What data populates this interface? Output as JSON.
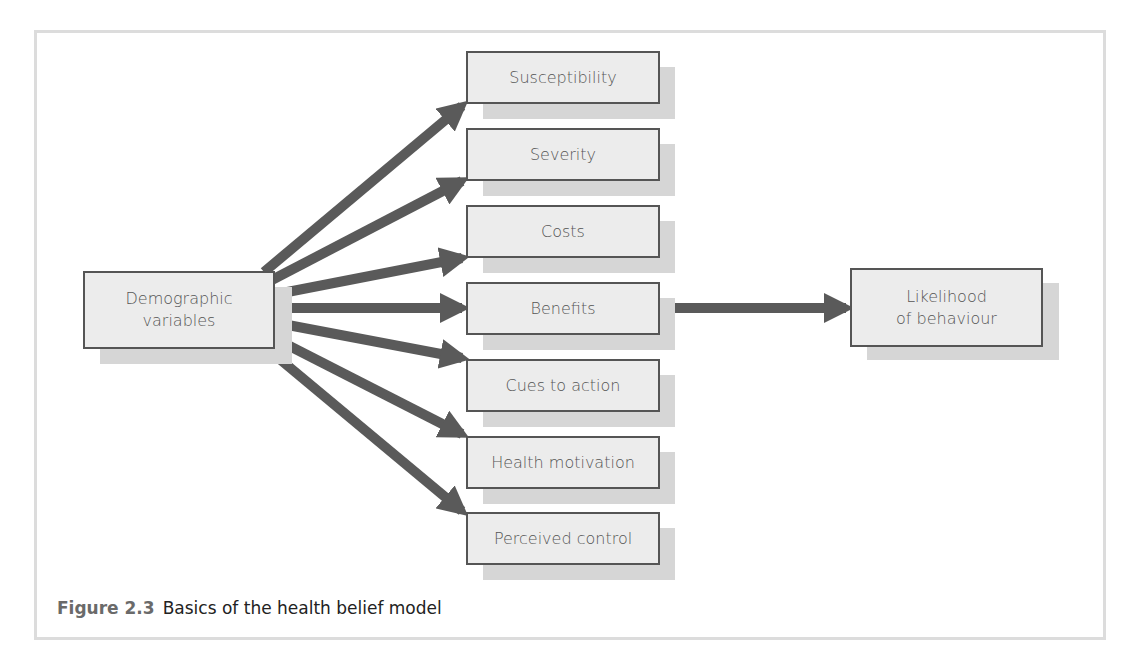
{
  "figure": {
    "label": "Figure 2.3",
    "title": "Basics of the health belief model"
  },
  "source_node": {
    "line1": "Demographic",
    "line2": "variables"
  },
  "middle_nodes": [
    {
      "label": "Susceptibility"
    },
    {
      "label": "Severity"
    },
    {
      "label": "Costs"
    },
    {
      "label": "Benefits"
    },
    {
      "label": "Cues to action"
    },
    {
      "label": "Health motivation"
    },
    {
      "label": "Perceived control"
    }
  ],
  "outcome_node": {
    "line1": "Likelihood",
    "line2": "of behaviour"
  },
  "colors": {
    "arrow": "#5a5a5a",
    "box_fill": "#ececec",
    "box_border": "#555555",
    "shadow": "#d6d6d6",
    "frame": "#dcdcdc"
  }
}
